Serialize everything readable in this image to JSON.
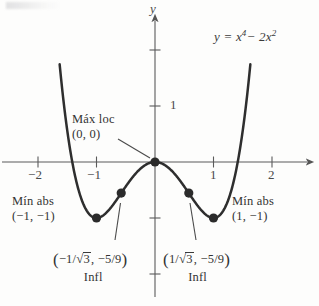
{
  "figure": {
    "kind": "cartesian-plot",
    "background": "#fdfdfc",
    "ink_color": "#333333",
    "curve_color": "#2e2e2e",
    "axis_color": "#555555"
  },
  "axes": {
    "x_name": "",
    "y_name": "y",
    "origin_px": [
      155,
      162
    ],
    "x_unit_px": 58.5,
    "y_unit_px": 56,
    "x_ticks": [
      {
        "value": -2,
        "label": "−2"
      },
      {
        "value": -1,
        "label": "−1"
      },
      {
        "value": 1,
        "label": "1"
      },
      {
        "value": 2,
        "label": "2"
      }
    ],
    "y_ticks": [
      {
        "value": 2,
        "label": ""
      },
      {
        "value": 1,
        "label": "1"
      },
      {
        "value": -1,
        "label": ""
      },
      {
        "value": -2,
        "label": ""
      }
    ],
    "xlim": [
      -2.62,
      2.72
    ],
    "ylim": [
      -2.5,
      2.85
    ],
    "grid": false
  },
  "equation": {
    "lhs": "y",
    "eq": "=",
    "term1_base": "x",
    "term1_exp": "4",
    "minus": "− 2",
    "term2_base": "x",
    "term2_exp": "2",
    "plain": "y = x⁴ − 2x²"
  },
  "annotations": {
    "max_loc": {
      "line1": "Máx loc",
      "line2": "(0, 0)",
      "points_to": [
        0,
        0
      ],
      "has_leader": true
    },
    "min_left": {
      "line1": "Mín abs",
      "line2": "(−1, −1)",
      "points_to": [
        -1,
        -1
      ]
    },
    "min_right": {
      "line1": "Mín abs",
      "line2": "(1, −1)",
      "points_to": [
        1,
        -1
      ]
    },
    "infl_left": {
      "open_paren": "(",
      "num": "−1/",
      "radical": "√",
      "radicand": "3",
      "comma": ", −5/9",
      "close_paren": ")",
      "caption": "Infl",
      "points_to": [
        -0.5774,
        -0.5556
      ],
      "plain": "(−1/√3, −5/9)"
    },
    "infl_right": {
      "open_paren": "(",
      "num": "1/",
      "radical": "√",
      "radicand": "3",
      "comma": ", −5/9",
      "close_paren": ")",
      "caption": "Infl",
      "points_to": [
        0.5774,
        -0.5556
      ],
      "plain": "(1/√3, −5/9)"
    }
  },
  "chart_data": {
    "type": "line",
    "title": "",
    "subtitle": "",
    "xlabel": "",
    "ylabel": "y",
    "legend": [
      "y = x⁴ − 2x²"
    ],
    "legend_position": "top-right-inline",
    "grid": false,
    "xlim": [
      -2.62,
      2.72
    ],
    "ylim": [
      -2.5,
      2.85
    ],
    "xticks": [
      -2,
      -1,
      1,
      2
    ],
    "yticks": [
      1
    ],
    "series": [
      {
        "name": "y = x⁴ − 2x²",
        "expression": "x**4 - 2*x**2",
        "domain": [
          -1.63,
          1.63
        ],
        "x": [
          -1.63,
          -1.5,
          -1.4,
          -1.3,
          -1.2,
          -1.1,
          -1.0,
          -0.9,
          -0.8,
          -0.7,
          -0.5774,
          -0.5,
          -0.4,
          -0.3,
          -0.2,
          -0.1,
          0.0,
          0.1,
          0.2,
          0.3,
          0.4,
          0.5,
          0.5774,
          0.7,
          0.8,
          0.9,
          1.0,
          1.1,
          1.2,
          1.3,
          1.4,
          1.5,
          1.63
        ],
        "y": [
          2.05,
          0.5625,
          -0.08,
          -0.524,
          -0.8064,
          -0.958,
          -1.0,
          -0.965,
          -0.8704,
          -0.7399,
          -0.5556,
          -0.4375,
          -0.2944,
          -0.1719,
          -0.0784,
          -0.0199,
          0.0,
          -0.0199,
          -0.0784,
          -0.1719,
          -0.2944,
          -0.4375,
          -0.5556,
          -0.7399,
          -0.8704,
          -0.965,
          -1.0,
          -0.958,
          -0.8064,
          -0.524,
          -0.08,
          0.5625,
          2.05
        ]
      }
    ],
    "markers": [
      {
        "label": "Máx loc",
        "x": 0,
        "y": 0,
        "kind": "local-maximum"
      },
      {
        "label": "Mín abs",
        "x": -1,
        "y": -1,
        "kind": "absolute-minimum"
      },
      {
        "label": "Mín abs",
        "x": 1,
        "y": -1,
        "kind": "absolute-minimum"
      },
      {
        "label": "Infl",
        "x": -0.5774,
        "y": -0.5556,
        "kind": "inflection"
      },
      {
        "label": "Infl",
        "x": 0.5774,
        "y": -0.5556,
        "kind": "inflection"
      }
    ]
  }
}
